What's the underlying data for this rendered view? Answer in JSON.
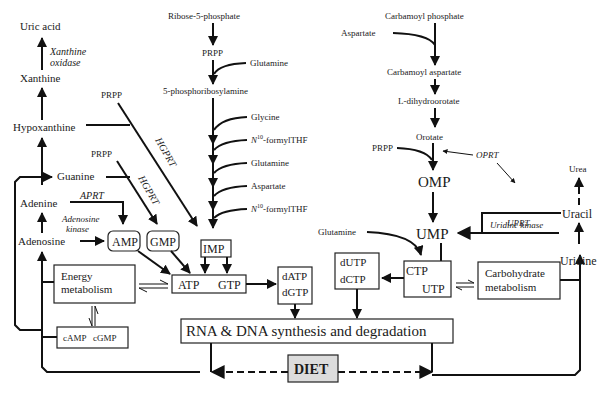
{
  "purine_catabolism": {
    "uric_acid": "Uric acid",
    "xanthine_oxidase_1": "Xanthine",
    "xanthine_oxidase_2": "oxidase",
    "xanthine": "Xanthine",
    "hypoxanthine": "Hypoxanthine",
    "guanine": "Guanine",
    "adenine": "Adenine",
    "adenosine": "Adenosine"
  },
  "salvage": {
    "prpp_top": "PRPP",
    "prpp_mid": "PRPP",
    "hgprt_1": "HGPRT",
    "hgprt_2": "HGPRT",
    "aprt": "APRT",
    "adenosine_kinase_1": "Adenosine",
    "adenosine_kinase_2": "kinase",
    "amp": "AMP",
    "gmp": "GMP"
  },
  "de_novo_purine": {
    "ribose5p": "Ribose-5-phosphate",
    "prpp": "PRPP",
    "glutamine_1": "Glutamine",
    "phosphoribosylamine": "5-phosphoribosylamine",
    "glycine": "Glycine",
    "formylthf_1_sup": "10",
    "formylthf_1": "-formylTHF",
    "glutamine_2": "Glutamine",
    "aspartate": "Aspartate",
    "formylthf_2_sup": "10",
    "formylthf_2": "-formylTHF",
    "n_label": "N",
    "imp": "IMP"
  },
  "nucleotides": {
    "atp": "ATP",
    "gtp": "GTP",
    "datp": "dATP",
    "dgtp": "dGTP",
    "dutp": "dUTP",
    "dctp": "dCTP",
    "ctp": "CTP",
    "utp": "UTP"
  },
  "de_novo_pyrimidine": {
    "carbamoyl_phosphate": "Carbamoyl phosphate",
    "aspartate": "Aspartate",
    "carbamoyl_aspartate": "Carbamoyl aspartate",
    "dihydroorotate": "L-dihydroorotate",
    "orotate": "Orotate",
    "prpp": "PRPP",
    "oprt": "OPRT",
    "omp": "OMP",
    "ump": "UMP",
    "glutamine": "Glutamine"
  },
  "pyrimidine_salvage": {
    "urea": "Urea",
    "uracil": "Uracil",
    "uprt": "UPRT",
    "uridine_kinase": "Uridine kinase",
    "uridine": "Uridine"
  },
  "boxes": {
    "energy_1": "Energy",
    "energy_2": "metabolism",
    "camp": "cAMP",
    "cgmp": "cGMP",
    "carb_1": "Carbohydrate",
    "carb_2": "metabolism",
    "rna_dna": "RNA & DNA synthesis and degradation",
    "diet": "DIET"
  }
}
